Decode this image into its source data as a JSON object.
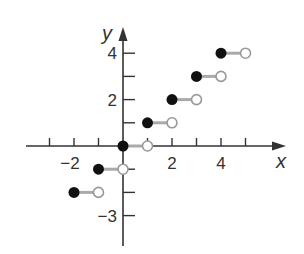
{
  "chart_data": {
    "type": "scatter",
    "title": "",
    "xlabel": "x",
    "ylabel": "y",
    "function": "floor(x)",
    "xlim": [
      -4,
      5.5
    ],
    "ylim": [
      -4,
      5
    ],
    "grid": false,
    "x_ticks": [
      -3,
      -2,
      -1,
      1,
      2,
      3,
      4,
      5
    ],
    "x_tick_labels": [
      {
        "value": -2,
        "label": "−2"
      },
      {
        "value": 2,
        "label": "2"
      },
      {
        "value": 4,
        "label": "4"
      }
    ],
    "y_ticks": [
      -3,
      -2,
      -1,
      1,
      2,
      3,
      4
    ],
    "y_tick_labels": [
      {
        "value": 4,
        "label": "4"
      },
      {
        "value": 2,
        "label": "2"
      },
      {
        "value": -3,
        "label": "−3"
      }
    ],
    "segments": [
      {
        "x_start": -2,
        "x_end": -1,
        "y": -2,
        "closed_start": true,
        "open_end": true
      },
      {
        "x_start": -1,
        "x_end": 0,
        "y": -1,
        "closed_start": true,
        "open_end": true
      },
      {
        "x_start": 0,
        "x_end": 1,
        "y": 0,
        "closed_start": true,
        "open_end": true
      },
      {
        "x_start": 1,
        "x_end": 2,
        "y": 1,
        "closed_start": true,
        "open_end": true
      },
      {
        "x_start": 2,
        "x_end": 3,
        "y": 2,
        "closed_start": true,
        "open_end": true
      },
      {
        "x_start": 3,
        "x_end": 4,
        "y": 3,
        "closed_start": true,
        "open_end": true
      },
      {
        "x_start": 4,
        "x_end": 5,
        "y": 4,
        "closed_start": true,
        "open_end": true
      }
    ],
    "colors": {
      "axis": "#333333",
      "segment": "#aaaaaa",
      "closed_dot": "#111111",
      "open_dot_stroke": "#999999",
      "open_dot_fill": "#ffffff"
    }
  },
  "labels": {
    "x_axis": "x",
    "y_axis": "y"
  }
}
